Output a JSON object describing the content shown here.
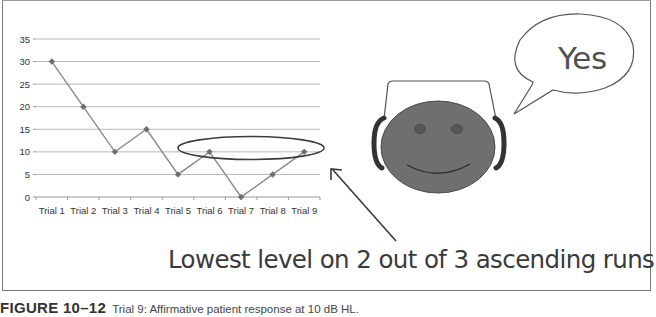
{
  "chart_data": {
    "type": "line",
    "title": "",
    "xlabel": "",
    "ylabel": "",
    "categories": [
      "Trial 1",
      "Trial 2",
      "Trial 3",
      "Trial 4",
      "Trial 5",
      "Trial 6",
      "Trial 7",
      "Trial 8",
      "Trial 9"
    ],
    "series": [
      {
        "name": "Presentation level (dB HL)",
        "values": [
          30,
          20,
          10,
          15,
          5,
          10,
          0,
          5,
          10
        ]
      }
    ],
    "ylim": [
      0,
      35
    ],
    "yticks": [
      0,
      5,
      10,
      15,
      20,
      25,
      30,
      35
    ],
    "grid": true,
    "legend": "none",
    "annotations": [
      {
        "type": "ellipse",
        "around": "10 dB level at Trial 6 and Trial 9"
      },
      {
        "type": "arrow",
        "text": "Lowest level on 2 out of 3 ascending runs"
      }
    ]
  },
  "illustration": {
    "speech_bubble_text": "Yes",
    "face": "smiling patient with headphones"
  },
  "annotation_text": "Lowest level on 2 out of 3 ascending runs",
  "caption": {
    "figure_label": "FIGURE 10–12",
    "text": "Trial 9: Affirmative patient response at 10 dB HL."
  },
  "colors": {
    "line": "#8a8a8a",
    "marker": "#6e6e6e",
    "grid": "#b8b8b8",
    "face_fill": "#6f6f6f",
    "eye_fill": "#5a5a5a",
    "frame": "#7a7a7a"
  }
}
